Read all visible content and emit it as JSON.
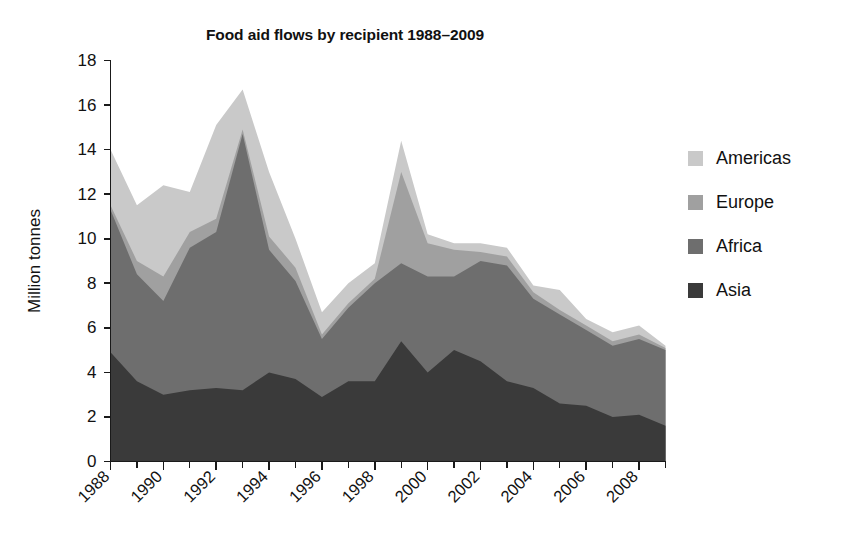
{
  "chart_data": {
    "type": "area",
    "stacked": true,
    "title": "Food aid flows by recipient 1988–2009",
    "xlabel": "",
    "ylabel": "Million tonnes",
    "ylim": [
      0,
      18
    ],
    "ytick_step": 2,
    "yticks": [
      0,
      2,
      4,
      6,
      8,
      10,
      12,
      14,
      16,
      18
    ],
    "xlim": [
      1988,
      2009
    ],
    "x": [
      1988,
      1989,
      1990,
      1991,
      1992,
      1993,
      1994,
      1995,
      1996,
      1997,
      1998,
      1999,
      2000,
      2001,
      2002,
      2003,
      2004,
      2005,
      2006,
      2007,
      2008,
      2009
    ],
    "xticks_labeled": [
      "1988",
      "1990",
      "1992",
      "1994",
      "1996",
      "1998",
      "2000",
      "2002",
      "2004",
      "2006",
      "2008"
    ],
    "grid": false,
    "legend_position": "right",
    "series": [
      {
        "name": "Asia",
        "color": "#3a3a3a",
        "values": [
          4.9,
          3.6,
          3.0,
          3.2,
          3.3,
          3.2,
          4.0,
          3.7,
          2.9,
          3.6,
          3.6,
          5.4,
          4.0,
          5.0,
          4.5,
          3.6,
          3.3,
          2.6,
          2.5,
          2.0,
          2.1,
          1.6
        ]
      },
      {
        "name": "Africa",
        "color": "#6e6e6e",
        "values": [
          6.4,
          4.8,
          4.2,
          6.4,
          7.0,
          11.5,
          5.5,
          4.4,
          2.6,
          3.3,
          4.4,
          3.5,
          4.3,
          3.3,
          4.5,
          5.2,
          4.0,
          4.0,
          3.4,
          3.2,
          3.4,
          3.4
        ]
      },
      {
        "name": "Europe",
        "color": "#a0a0a0",
        "values": [
          0.2,
          0.6,
          1.1,
          0.7,
          0.6,
          0.2,
          0.6,
          0.6,
          0.2,
          0.2,
          0.2,
          4.1,
          1.5,
          1.2,
          0.4,
          0.4,
          0.3,
          0.2,
          0.2,
          0.2,
          0.2,
          0.1
        ]
      },
      {
        "name": "Americas",
        "color": "#c9c9c9",
        "values": [
          2.5,
          2.5,
          4.1,
          1.8,
          4.2,
          1.8,
          2.9,
          1.3,
          1.0,
          0.9,
          0.7,
          1.4,
          0.4,
          0.3,
          0.4,
          0.4,
          0.3,
          0.9,
          0.3,
          0.4,
          0.4,
          0.1
        ]
      }
    ],
    "totals": [
      14.0,
      11.5,
      12.4,
      12.1,
      15.1,
      16.7,
      13.0,
      10.0,
      6.7,
      8.0,
      8.9,
      14.4,
      10.2,
      9.8,
      9.8,
      9.6,
      7.9,
      7.7,
      6.4,
      5.8,
      6.1,
      5.2
    ]
  },
  "legend": {
    "items": [
      {
        "label": "Americas",
        "color": "#c9c9c9"
      },
      {
        "label": "Europe",
        "color": "#a0a0a0"
      },
      {
        "label": "Africa",
        "color": "#6e6e6e"
      },
      {
        "label": "Asia",
        "color": "#3a3a3a"
      }
    ]
  }
}
